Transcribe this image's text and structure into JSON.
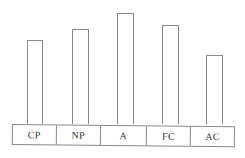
{
  "chart_data": {
    "type": "bar",
    "title": "",
    "xlabel": "",
    "ylabel": "",
    "grid": false,
    "legend": null,
    "categories": [
      "CP",
      "NP",
      "A",
      "FC",
      "AC"
    ],
    "values": [
      84,
      95,
      111,
      99,
      69
    ],
    "value_units": "relative bar height (no axis shown)",
    "ylim": [
      0,
      120
    ]
  },
  "style": {
    "line_color": "#8a8a8a",
    "text_color": "#333333",
    "bar_fill": "#ffffff"
  },
  "layout": {
    "baseline_y": 124,
    "bars": [
      {
        "label": "CP",
        "x": 27,
        "width": 16
      },
      {
        "label": "NP",
        "x": 72,
        "width": 17
      },
      {
        "label": "A",
        "x": 117,
        "width": 17
      },
      {
        "label": "FC",
        "x": 162,
        "width": 17
      },
      {
        "label": "AC",
        "x": 206,
        "width": 17
      }
    ],
    "cells": [
      {
        "label": "CP",
        "width": 44
      },
      {
        "label": "NP",
        "width": 45
      },
      {
        "label": "A",
        "width": 46
      },
      {
        "label": "FC",
        "width": 45
      },
      {
        "label": "AC",
        "width": 43
      }
    ]
  }
}
